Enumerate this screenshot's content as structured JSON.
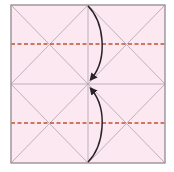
{
  "diagram": {
    "type": "origami-fold-step",
    "colors": {
      "paper_fill": "#fbe8f1",
      "border": "#9a9097",
      "crease": "#b9a9b3",
      "valley_fold": "#c0502e",
      "arrow": "#2a2228"
    },
    "square": {
      "x": 11,
      "y": 5,
      "width": 154,
      "height": 158
    },
    "creases": [
      {
        "name": "vertical-center",
        "x1": 88,
        "y1": 5,
        "x2": 88,
        "y2": 163
      },
      {
        "name": "horizontal-center",
        "x1": 11,
        "y1": 84,
        "x2": 165,
        "y2": 84
      },
      {
        "name": "diagonal-a",
        "x1": 11,
        "y1": 5,
        "x2": 165,
        "y2": 163
      },
      {
        "name": "diagonal-b",
        "x1": 165,
        "y1": 5,
        "x2": 11,
        "y2": 163
      },
      {
        "name": "upper-left-diag",
        "x1": 11,
        "y1": 84,
        "x2": 88,
        "y2": 5
      },
      {
        "name": "upper-right-diag",
        "x1": 88,
        "y1": 5,
        "x2": 165,
        "y2": 84
      },
      {
        "name": "lower-left-diag",
        "x1": 11,
        "y1": 84,
        "x2": 88,
        "y2": 163
      },
      {
        "name": "lower-right-diag",
        "x1": 88,
        "y1": 163,
        "x2": 165,
        "y2": 84
      }
    ],
    "valley_folds": [
      {
        "name": "upper-quarter-fold",
        "y": 44
      },
      {
        "name": "lower-quarter-fold",
        "y": 123
      }
    ],
    "arrows": [
      {
        "name": "top-edge-to-center",
        "from": [
          88,
          5
        ],
        "to": [
          89,
          80
        ]
      },
      {
        "name": "bottom-edge-to-center",
        "from": [
          88,
          163
        ],
        "to": [
          89,
          88
        ]
      }
    ]
  }
}
